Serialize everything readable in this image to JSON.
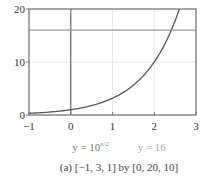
{
  "chart_data": {
    "type": "line",
    "title": "",
    "xlabel": "",
    "ylabel": "",
    "xlim": [
      -1,
      3
    ],
    "ylim": [
      0,
      20
    ],
    "x_step": 1,
    "y_step": 10,
    "x_ticks": [
      -1,
      0,
      1,
      2,
      3
    ],
    "x_tick_labels": [
      "−1",
      "0",
      "1",
      "2",
      "3"
    ],
    "y_ticks": [
      0,
      10,
      20
    ],
    "y_tick_labels": [
      "0",
      "10",
      "20"
    ],
    "grid": true,
    "series": [
      {
        "name": "y = 10^(x/2)",
        "expression": "10^(x/2)",
        "x": [
          -1,
          -0.5,
          0,
          0.5,
          1,
          1.5,
          2,
          2.25,
          2.5,
          2.602
        ],
        "values": [
          0.316,
          0.562,
          1,
          1.778,
          3.162,
          5.623,
          10,
          13.335,
          17.783,
          20
        ],
        "color": "#555555"
      },
      {
        "name": "y = 16",
        "expression": "16",
        "x": [
          -1,
          3
        ],
        "values": [
          16,
          16
        ],
        "color": "#999999"
      }
    ],
    "legend": {
      "placement": "bottom",
      "entries": [
        {
          "base": "y = 10",
          "exponent": "x/2",
          "color": "#777777"
        },
        {
          "text": "y = 16",
          "color": "#aaaaaa"
        }
      ]
    },
    "caption": "(a) [−1, 3, 1] by [0, 20, 10]"
  }
}
